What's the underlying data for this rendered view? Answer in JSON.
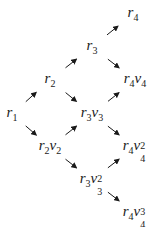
{
  "diagram": {
    "nodes": [
      {
        "id": "r4",
        "base": "r",
        "base_sub": "4",
        "var": "",
        "var_sub": "",
        "var_sup": "",
        "x": 133,
        "y": 14
      },
      {
        "id": "r3",
        "base": "r",
        "base_sub": "3",
        "var": "",
        "var_sub": "",
        "var_sup": "",
        "x": 92,
        "y": 47
      },
      {
        "id": "r2",
        "base": "r",
        "base_sub": "2",
        "var": "",
        "var_sub": "",
        "var_sup": "",
        "x": 50,
        "y": 80
      },
      {
        "id": "r4v4",
        "base": "r",
        "base_sub": "4",
        "var": "v",
        "var_sub": "4",
        "var_sup": "",
        "x": 135,
        "y": 80
      },
      {
        "id": "r1",
        "base": "r",
        "base_sub": "1",
        "var": "",
        "var_sub": "",
        "var_sup": "",
        "x": 12,
        "y": 114
      },
      {
        "id": "r3v3",
        "base": "r",
        "base_sub": "3",
        "var": "v",
        "var_sub": "3",
        "var_sup": "",
        "x": 92,
        "y": 114
      },
      {
        "id": "r2v2",
        "base": "r",
        "base_sub": "2",
        "var": "v",
        "var_sub": "2",
        "var_sup": "",
        "x": 50,
        "y": 147
      },
      {
        "id": "r4v4_2",
        "base": "r",
        "base_sub": "4",
        "var": "v",
        "var_sub": "4",
        "var_sup": "2",
        "x": 135,
        "y": 147
      },
      {
        "id": "r3v3_2",
        "base": "r",
        "base_sub": "3",
        "var": "v",
        "var_sub": "3",
        "var_sup": "2",
        "x": 92,
        "y": 180
      },
      {
        "id": "r4v4_3",
        "base": "r",
        "base_sub": "4",
        "var": "v",
        "var_sub": "4",
        "var_sup": "3",
        "x": 135,
        "y": 213
      }
    ],
    "edges": [
      {
        "from": "r1",
        "to": "r2",
        "direction": "NE"
      },
      {
        "from": "r1",
        "to": "r2v2",
        "direction": "SE"
      },
      {
        "from": "r2",
        "to": "r3",
        "direction": "NE"
      },
      {
        "from": "r2",
        "to": "r3v3",
        "direction": "SE"
      },
      {
        "from": "r2v2",
        "to": "r3v3",
        "direction": "NE"
      },
      {
        "from": "r2v2",
        "to": "r3v3_2",
        "direction": "SE"
      },
      {
        "from": "r3",
        "to": "r4",
        "direction": "NE"
      },
      {
        "from": "r3",
        "to": "r4v4",
        "direction": "SE"
      },
      {
        "from": "r3v3",
        "to": "r4v4",
        "direction": "NE"
      },
      {
        "from": "r3v3",
        "to": "r4v4_2",
        "direction": "SE"
      },
      {
        "from": "r3v3_2",
        "to": "r4v4_2",
        "direction": "NE"
      },
      {
        "from": "r3v3_2",
        "to": "r4v4_3",
        "direction": "SE"
      }
    ],
    "colors": {
      "text": "#1a1a1a",
      "arrow": "#1a1a1a",
      "background": "#ffffff"
    }
  }
}
